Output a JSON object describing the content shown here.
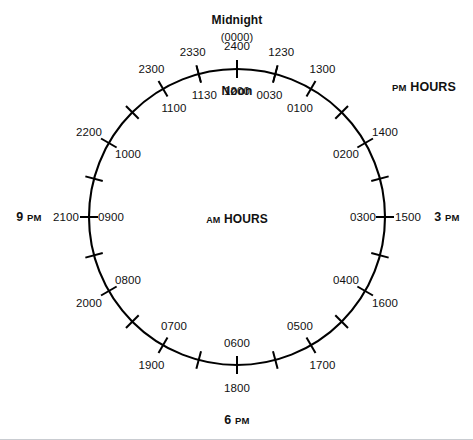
{
  "diagram": {
    "center": {
      "x": 237,
      "y": 217
    },
    "radius": 148,
    "stroke_color": "#000000",
    "background": "#ffffff",
    "am_hours_label": {
      "small_caps": "AM",
      "rest": " HOURS"
    },
    "pm_hours_label": {
      "small_caps": "PM",
      "rest": " HOURS"
    },
    "midnight_label": "Midnight",
    "midnight_paren": "(0000)",
    "midnight_value": "2400",
    "noon_value": "1200",
    "noon_label": "Noon",
    "left_marker": {
      "civil": "9",
      "suffix": "PM"
    },
    "right_marker": {
      "civil": "3",
      "suffix": "PM"
    },
    "bottom_marker": {
      "civil": "6",
      "suffix": "PM"
    },
    "half_hour_ticks": [
      "0030",
      "1230",
      "1130",
      "2330"
    ]
  },
  "chart_data": {
    "type": "pie",
    "xlabel": "",
    "ylabel": "",
    "legend": [
      "AM HOURS",
      "PM HOURS"
    ],
    "categories": [
      "2400",
      "0100",
      "0200",
      "0300",
      "0400",
      "0500",
      "0600",
      "0700",
      "0800",
      "0900",
      "1000",
      "1100",
      "1200",
      "1300",
      "1400",
      "1500",
      "1600",
      "1700",
      "1800",
      "1900",
      "2000",
      "2100",
      "2200",
      "2300"
    ],
    "values": [
      15,
      15,
      15,
      15,
      15,
      15,
      15,
      15,
      15,
      15,
      15,
      15,
      15,
      15,
      15,
      15,
      15,
      15,
      15,
      15,
      15,
      15,
      15,
      15
    ]
  },
  "inner_labels": [
    {
      "text": "2400",
      "angle": 0,
      "inner": false
    },
    {
      "text": "0030",
      "angle": 15,
      "inner": true
    },
    {
      "text": "0100",
      "angle": 30,
      "inner": true
    },
    {
      "text": "0200",
      "angle": 60,
      "inner": true
    },
    {
      "text": "0300",
      "angle": 90,
      "inner": true
    },
    {
      "text": "0400",
      "angle": 120,
      "inner": true
    },
    {
      "text": "0500",
      "angle": 150,
      "inner": true
    },
    {
      "text": "0600",
      "angle": 180,
      "inner": true
    },
    {
      "text": "0700",
      "angle": 210,
      "inner": true
    },
    {
      "text": "0800",
      "angle": 240,
      "inner": true
    },
    {
      "text": "0900",
      "angle": 270,
      "inner": true
    },
    {
      "text": "1000",
      "angle": 300,
      "inner": true
    },
    {
      "text": "1100",
      "angle": 330,
      "inner": true
    },
    {
      "text": "1130",
      "angle": 345,
      "inner": true
    },
    {
      "text": "1200",
      "angle": 0,
      "inner": true
    }
  ],
  "outer_labels": [
    {
      "text": "1230",
      "angle": 15,
      "inner": false
    },
    {
      "text": "1300",
      "angle": 30,
      "inner": false
    },
    {
      "text": "1400",
      "angle": 60,
      "inner": false
    },
    {
      "text": "1500",
      "angle": 90,
      "inner": false
    },
    {
      "text": "1600",
      "angle": 120,
      "inner": false
    },
    {
      "text": "1700",
      "angle": 150,
      "inner": false
    },
    {
      "text": "1800",
      "angle": 180,
      "inner": false
    },
    {
      "text": "1900",
      "angle": 210,
      "inner": false
    },
    {
      "text": "2000",
      "angle": 240,
      "inner": false
    },
    {
      "text": "2100",
      "angle": 270,
      "inner": false
    },
    {
      "text": "2200",
      "angle": 300,
      "inner": false
    },
    {
      "text": "2300",
      "angle": 330,
      "inner": false
    },
    {
      "text": "2330",
      "angle": 345,
      "inner": false
    }
  ]
}
